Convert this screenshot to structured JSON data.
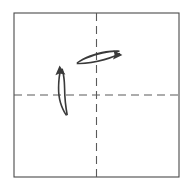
{
  "diagram": {
    "title": "Origami fold step: square sheet with two centre creases",
    "type": "origami-fold-instruction",
    "canvas": {
      "width": 188,
      "height": 182,
      "background": "#ffffff"
    },
    "sheet": {
      "label": "Paper sheet",
      "shape": "square",
      "x": 14,
      "y": 13,
      "width": 165,
      "height": 164,
      "stroke_color": "#4a4a4a",
      "stroke_width": 1.1,
      "fill_color": "#ffffff"
    },
    "creases": [
      {
        "label": "Vertical centre crease",
        "orientation": "vertical",
        "style": "dashed",
        "x1": 96.5,
        "y1": 13,
        "x2": 96.5,
        "y2": 177,
        "color": "#5a5a5a",
        "stroke_width": 1.1,
        "dash": "8 5"
      },
      {
        "label": "Horizontal centre crease",
        "orientation": "horizontal",
        "style": "dashed",
        "x1": 14,
        "y1": 95,
        "x2": 179,
        "y2": 95,
        "color": "#5a5a5a",
        "stroke_width": 1.1,
        "dash": "8 5"
      }
    ],
    "arrows": [
      {
        "label": "Fold right arrow",
        "direction": "right",
        "crosses": "Vertical centre crease",
        "tip_x": 121,
        "tip_y": 55,
        "tail_x": 76,
        "tail_y": 62,
        "color": "#3a3a3a"
      },
      {
        "label": "Fold up arrow",
        "direction": "up",
        "crosses": "Horizontal centre crease",
        "tip_x": 60,
        "tip_y": 67,
        "tail_x": 66,
        "tail_y": 116,
        "color": "#3a3a3a"
      }
    ]
  }
}
